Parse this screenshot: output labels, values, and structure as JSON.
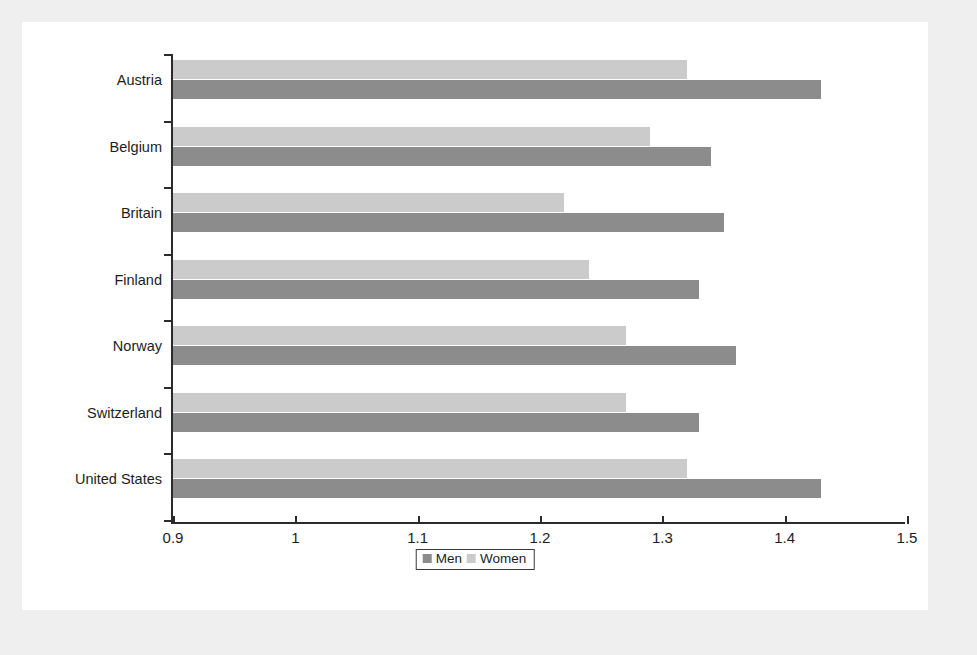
{
  "chart_data": {
    "type": "bar",
    "orientation": "horizontal",
    "title": "",
    "subtitle": "",
    "xlabel": "",
    "ylabel": "",
    "categories": [
      "Austria",
      "Belgium",
      "Britain",
      "Finland",
      "Norway",
      "Switzerland",
      "United States"
    ],
    "series": [
      {
        "name": "Men",
        "color": "#8c8c8c",
        "values": [
          1.43,
          1.34,
          1.35,
          1.33,
          1.36,
          1.33,
          1.43
        ]
      },
      {
        "name": "Women",
        "color": "#cbcbcb",
        "values": [
          1.32,
          1.29,
          1.22,
          1.24,
          1.27,
          1.27,
          1.32
        ]
      }
    ],
    "xlim": [
      0.9,
      1.5
    ],
    "xticks": [
      0.9,
      1.0,
      1.1,
      1.2,
      1.3,
      1.4,
      1.5
    ],
    "xtick_labels": [
      "0.9",
      "1",
      "1.1",
      "1.2",
      "1.3",
      "1.4",
      "1.5"
    ],
    "grid": false,
    "legend": {
      "position": "bottom-center",
      "entries": [
        "Men",
        "Women"
      ]
    }
  },
  "colors": {
    "men": "#8c8c8c",
    "women": "#cbcbcb",
    "axis": "#2b2b2b",
    "text": "#1d1d1d",
    "card": "#ffffff",
    "page": "#efefef"
  }
}
